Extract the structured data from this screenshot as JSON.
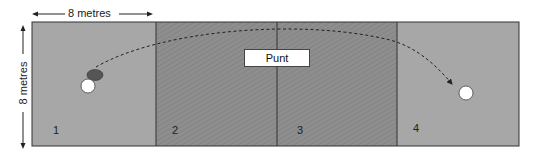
{
  "dimensions": {
    "horizontal_label": "8 metres",
    "vertical_label": "8 metres"
  },
  "action_label": "Punt",
  "zones": [
    {
      "number": "1",
      "shade": "light",
      "color": "#a6a6a6"
    },
    {
      "number": "2",
      "shade": "dark-hatched",
      "color": "#8c8c8c"
    },
    {
      "number": "3",
      "shade": "dark-hatched",
      "color": "#8c8c8c"
    },
    {
      "number": "4",
      "shade": "light",
      "color": "#a6a6a6"
    }
  ],
  "markers": {
    "player": {
      "zone": "1",
      "color": "#555555"
    },
    "ball_start": {
      "zone": "1",
      "color": "#ffffff"
    },
    "ball_end": {
      "zone": "4",
      "color": "#ffffff"
    }
  }
}
